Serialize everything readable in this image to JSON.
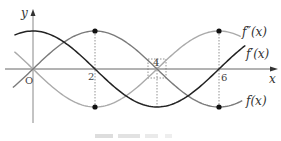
{
  "figure": {
    "axes": {
      "x_label": "x",
      "y_label": "y",
      "origin_label": "O",
      "ticks": [
        "2",
        "4",
        "6"
      ]
    },
    "curves": [
      {
        "name": "f(x)",
        "label": "f(x)",
        "color": "#7a7a7a",
        "description": "0 at x=0, max at x=2, 0 at x=4, min at x=6"
      },
      {
        "name": "f'(x)",
        "label": "f′(x)",
        "color": "#222222",
        "description": "max at x=0, 0 at x=2, min at x=4, 0 at x=6"
      },
      {
        "name": "f''(x)",
        "label": "f″(x)",
        "color": "#aaaaaa",
        "description": "0 at x=0, min at x=2, 0 at x=4, max at x=6"
      }
    ],
    "marked_points": [
      {
        "x": 2,
        "curve": "f(x)",
        "type": "max"
      },
      {
        "x": 2,
        "curve": "f''(x)",
        "type": "min"
      },
      {
        "x": 6,
        "curve": "f''(x)",
        "type": "max"
      },
      {
        "x": 6,
        "curve": "f(x)",
        "type": "min"
      }
    ]
  }
}
